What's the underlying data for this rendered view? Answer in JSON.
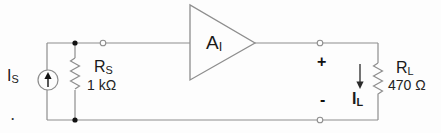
{
  "colors": {
    "wire": "#8e8e8e",
    "text": "#1a1a1a",
    "symbol_fill": "#fdfdfd",
    "dot": "#111111",
    "background": "#fdfdfd"
  },
  "labels": {
    "source_current": {
      "base": "I",
      "sub": "S"
    },
    "source_resistor": {
      "base": "R",
      "sub": "S",
      "value": "1 kΩ"
    },
    "amplifier_gain": {
      "base": "A",
      "sub": "I"
    },
    "output_plus": "+",
    "output_minus": "-",
    "load_current": {
      "base": "I",
      "sub": "L"
    },
    "load_resistor": {
      "base": "R",
      "sub": "L",
      "value": "470 Ω"
    },
    "stray_dot": "."
  }
}
